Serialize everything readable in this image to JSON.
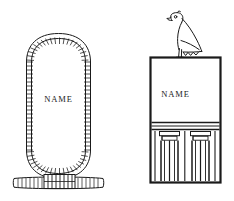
{
  "figure": {
    "background_color": "#ffffff",
    "ink_color": "#1a1a1a",
    "panels": [
      {
        "id": "cartouche",
        "name": "cartouche",
        "description": "Egyptian royal cartouche: a vertical oval rope loop tied at the base",
        "name_label": "NAME",
        "parts": [
          {
            "name": "rope-loop",
            "label": "rope loop"
          },
          {
            "name": "rope-hatching",
            "label": "rope twist hatching"
          },
          {
            "name": "tie-bar",
            "label": "horizontal tie bar"
          },
          {
            "name": "tie-binding",
            "label": "knotted binding"
          }
        ]
      },
      {
        "id": "serekh",
        "name": "serekh",
        "description": "Egyptian serekh: rectangular palace-facade frame surmounted by a Horus falcon",
        "name_label": "NAME",
        "parts": [
          {
            "name": "horus-falcon",
            "label": "Horus falcon"
          },
          {
            "name": "name-panel",
            "label": "name panel"
          },
          {
            "name": "cornice-bands",
            "label": "cornice bands"
          },
          {
            "name": "palace-facade",
            "label": "palace facade niching"
          },
          {
            "name": "facade-niche",
            "label": "recessed niche"
          }
        ]
      }
    ]
  }
}
